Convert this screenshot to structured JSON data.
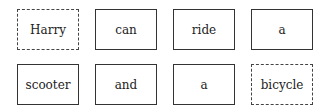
{
  "rows": [
    [
      {
        "word": "Harry",
        "style": "dashed"
      },
      {
        "word": "can",
        "style": "solid"
      },
      {
        "word": "ride",
        "style": "solid"
      },
      {
        "word": "a",
        "style": "solid"
      }
    ],
    [
      {
        "word": "scooter",
        "style": "solid"
      },
      {
        "word": "and",
        "style": "solid"
      },
      {
        "word": "a",
        "style": "solid"
      },
      {
        "word": "bicycle",
        "style": "dashed"
      }
    ]
  ]
}
